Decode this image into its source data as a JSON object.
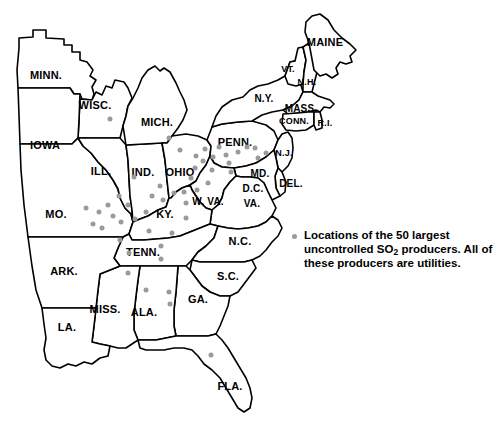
{
  "map": {
    "title": "Eastern United States SO2 producers map",
    "background_color": "#ffffff",
    "border_color": "#000000",
    "dot_color": "#9a9a9a",
    "state_labels": [
      {
        "name": "minnesota",
        "text": "MINN.",
        "x": 46,
        "y": 75,
        "size": "sz-lg"
      },
      {
        "name": "wisconsin",
        "text": "WISC.",
        "x": 95,
        "y": 105,
        "size": "sz-lg"
      },
      {
        "name": "iowa",
        "text": "IOWA",
        "x": 45,
        "y": 145,
        "size": "sz-lg"
      },
      {
        "name": "michigan",
        "text": "MICH.",
        "x": 157,
        "y": 122,
        "size": "sz-lg"
      },
      {
        "name": "illinois",
        "text": "ILL.",
        "x": 101,
        "y": 171,
        "size": "sz-lg"
      },
      {
        "name": "indiana",
        "text": "IND.",
        "x": 143,
        "y": 172,
        "size": "sz-lg"
      },
      {
        "name": "ohio",
        "text": "OHIO",
        "x": 180,
        "y": 172,
        "size": "sz-lg"
      },
      {
        "name": "missouri",
        "text": "MO.",
        "x": 56,
        "y": 214,
        "size": "sz-lg"
      },
      {
        "name": "kentucky",
        "text": "KY.",
        "x": 165,
        "y": 214,
        "size": "sz-lg"
      },
      {
        "name": "west-virginia",
        "text": "W. VA.",
        "x": 208,
        "y": 201,
        "size": "sz-md"
      },
      {
        "name": "virginia",
        "text": "VA.",
        "x": 252,
        "y": 203,
        "size": "sz-md"
      },
      {
        "name": "pennsylvania",
        "text": "PENN.",
        "x": 235,
        "y": 142,
        "size": "sz-lg"
      },
      {
        "name": "maryland",
        "text": "MD.",
        "x": 260,
        "y": 173,
        "size": "sz-md"
      },
      {
        "name": "dc",
        "text": "D.C.",
        "x": 253,
        "y": 188,
        "size": "sz-md"
      },
      {
        "name": "delaware",
        "text": "DEL.",
        "x": 291,
        "y": 183,
        "size": "sz-md"
      },
      {
        "name": "new-jersey",
        "text": "N.J.",
        "x": 284,
        "y": 153,
        "size": "sz-sm"
      },
      {
        "name": "new-york",
        "text": "N.Y.",
        "x": 264,
        "y": 98,
        "size": "sz-md"
      },
      {
        "name": "massachusetts",
        "text": "MASS.",
        "x": 301,
        "y": 108,
        "size": "sz-md"
      },
      {
        "name": "connecticut",
        "text": "CONN.",
        "x": 294,
        "y": 121,
        "size": "sz-sm"
      },
      {
        "name": "rhode-island",
        "text": "R.I.",
        "x": 325,
        "y": 123,
        "size": "sz-sm"
      },
      {
        "name": "vermont",
        "text": "VT.",
        "x": 288,
        "y": 69,
        "size": "sz-sm"
      },
      {
        "name": "new-hampshire",
        "text": "N.H.",
        "x": 307,
        "y": 82,
        "size": "sz-sm"
      },
      {
        "name": "maine",
        "text": "MAINE",
        "x": 325,
        "y": 42,
        "size": "sz-lg"
      },
      {
        "name": "tennessee",
        "text": "TENN.",
        "x": 143,
        "y": 252,
        "size": "sz-lg"
      },
      {
        "name": "north-carolina",
        "text": "N.C.",
        "x": 240,
        "y": 241,
        "size": "sz-lg"
      },
      {
        "name": "south-carolina",
        "text": "S.C.",
        "x": 228,
        "y": 276,
        "size": "sz-lg"
      },
      {
        "name": "arkansas",
        "text": "ARK.",
        "x": 64,
        "y": 271,
        "size": "sz-lg"
      },
      {
        "name": "mississippi",
        "text": "MISS.",
        "x": 105,
        "y": 309,
        "size": "sz-lg"
      },
      {
        "name": "alabama",
        "text": "ALA.",
        "x": 144,
        "y": 312,
        "size": "sz-lg"
      },
      {
        "name": "georgia",
        "text": "GA.",
        "x": 198,
        "y": 299,
        "size": "sz-lg"
      },
      {
        "name": "louisiana",
        "text": "LA.",
        "x": 67,
        "y": 327,
        "size": "sz-lg"
      },
      {
        "name": "florida",
        "text": "FLA.",
        "x": 230,
        "y": 386,
        "size": "sz-lg"
      }
    ],
    "producer_dots": [
      {
        "x": 110,
        "y": 119
      },
      {
        "x": 134,
        "y": 177
      },
      {
        "x": 169,
        "y": 138
      },
      {
        "x": 180,
        "y": 150
      },
      {
        "x": 86,
        "y": 208
      },
      {
        "x": 99,
        "y": 212
      },
      {
        "x": 108,
        "y": 205
      },
      {
        "x": 119,
        "y": 196
      },
      {
        "x": 128,
        "y": 205
      },
      {
        "x": 93,
        "y": 224
      },
      {
        "x": 102,
        "y": 228
      },
      {
        "x": 113,
        "y": 216
      },
      {
        "x": 121,
        "y": 222
      },
      {
        "x": 135,
        "y": 219
      },
      {
        "x": 146,
        "y": 212
      },
      {
        "x": 152,
        "y": 196
      },
      {
        "x": 160,
        "y": 186
      },
      {
        "x": 163,
        "y": 200
      },
      {
        "x": 174,
        "y": 193
      },
      {
        "x": 184,
        "y": 192
      },
      {
        "x": 186,
        "y": 203
      },
      {
        "x": 191,
        "y": 178
      },
      {
        "x": 195,
        "y": 168
      },
      {
        "x": 203,
        "y": 161
      },
      {
        "x": 196,
        "y": 156
      },
      {
        "x": 205,
        "y": 149
      },
      {
        "x": 213,
        "y": 157
      },
      {
        "x": 212,
        "y": 170
      },
      {
        "x": 219,
        "y": 147
      },
      {
        "x": 226,
        "y": 155
      },
      {
        "x": 229,
        "y": 163
      },
      {
        "x": 231,
        "y": 172
      },
      {
        "x": 238,
        "y": 152
      },
      {
        "x": 247,
        "y": 147
      },
      {
        "x": 255,
        "y": 148
      },
      {
        "x": 258,
        "y": 158
      },
      {
        "x": 266,
        "y": 153
      },
      {
        "x": 208,
        "y": 183
      },
      {
        "x": 197,
        "y": 190
      },
      {
        "x": 186,
        "y": 218
      },
      {
        "x": 172,
        "y": 233
      },
      {
        "x": 149,
        "y": 231
      },
      {
        "x": 120,
        "y": 240
      },
      {
        "x": 129,
        "y": 253
      },
      {
        "x": 161,
        "y": 246
      },
      {
        "x": 161,
        "y": 259
      },
      {
        "x": 128,
        "y": 273
      },
      {
        "x": 146,
        "y": 290
      },
      {
        "x": 169,
        "y": 292
      },
      {
        "x": 170,
        "y": 304
      },
      {
        "x": 211,
        "y": 355
      }
    ]
  },
  "legend": {
    "text_part1": "Locations of the 50 largest uncontrolled SO",
    "subscript": "2",
    "text_part2": " producers. All of these producers are utilities."
  }
}
